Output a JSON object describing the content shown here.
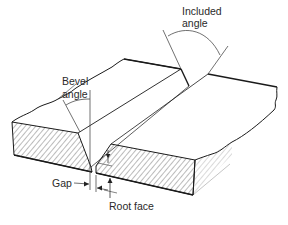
{
  "diagram": {
    "type": "technical-illustration",
    "labels": {
      "included_angle_line1": "Included",
      "included_angle_line2": "angle",
      "bevel_angle_line1": "Bevel",
      "bevel_angle_line2": "angle",
      "gap": "Gap",
      "root_face": "Root face"
    },
    "colors": {
      "line": "#1a1a1a",
      "hatch": "#555555",
      "background": "#ffffff"
    }
  }
}
